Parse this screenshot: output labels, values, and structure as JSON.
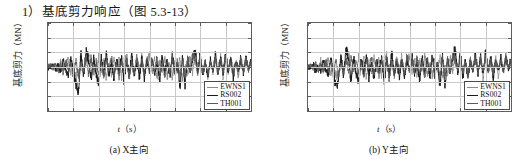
{
  "heading": "1）基底剪力响应（图 5.3-13）",
  "figures": [
    {
      "caption": "(a) X主向",
      "ylabel": "基底剪力（MN）",
      "xlabel_var": "t",
      "xlabel_unit": "（s）"
    },
    {
      "caption": "(b) Y主向",
      "ylabel": "基底剪力（MN）",
      "xlabel_var": "t",
      "xlabel_unit": "（s）"
    }
  ],
  "legend": {
    "items": [
      {
        "label": "EWNS1",
        "color": "#8c8c8c"
      },
      {
        "label": "RS002",
        "color": "#1a1a1a"
      },
      {
        "label": "TH001",
        "color": "#5a5a5a"
      }
    ]
  },
  "axis": {
    "y_ticks": [
      "300",
      "200",
      "100",
      "0",
      "-100",
      "-200",
      "-300"
    ],
    "x_ticks": [
      "0",
      "5",
      "10",
      "15",
      "20",
      "25",
      "30",
      "35",
      "40"
    ]
  },
  "chart_data": [
    {
      "type": "line",
      "title": "(a) X主向",
      "xlabel": "t (s)",
      "ylabel": "基底剪力 (MN)",
      "xlim": [
        0,
        40
      ],
      "ylim": [
        -300,
        300
      ],
      "xticks": [
        0,
        5,
        10,
        15,
        20,
        25,
        30,
        35,
        40
      ],
      "yticks": [
        -300,
        -200,
        -100,
        0,
        100,
        200,
        300
      ],
      "grid": true,
      "legend_position": "lower-right",
      "series": [
        {
          "name": "EWNS1",
          "color": "#8c8c8c",
          "x": [
            0,
            0.5,
            1,
            1.5,
            2,
            2.5,
            3,
            3.5,
            4,
            4.5,
            5,
            5.5,
            6,
            6.5,
            7,
            7.5,
            8,
            8.5,
            9,
            9.5,
            10,
            10.5,
            11,
            11.5,
            12,
            12.5,
            13,
            13.5,
            14,
            14.5,
            15,
            15.5,
            16,
            16.5,
            17,
            17.5,
            18,
            18.5,
            19,
            19.5,
            20,
            20.5,
            21,
            21.5,
            22,
            22.5,
            23,
            23.5,
            24,
            24.5,
            25,
            25.5,
            26,
            26.5,
            27,
            27.5,
            28,
            28.5,
            29,
            29.5,
            30,
            30.5,
            31,
            31.5,
            32,
            32.5,
            33,
            33.5,
            34,
            34.5,
            35,
            35.5,
            36,
            36.5,
            37,
            37.5,
            38,
            38.5,
            39,
            39.5,
            40
          ],
          "y": [
            0,
            10,
            -15,
            30,
            -20,
            45,
            -35,
            25,
            60,
            -55,
            40,
            -110,
            -60,
            95,
            -40,
            70,
            130,
            -80,
            55,
            -95,
            85,
            -45,
            65,
            -120,
            50,
            -70,
            95,
            -30,
            75,
            -85,
            60,
            110,
            -65,
            40,
            -100,
            80,
            -50,
            90,
            -75,
            45,
            120,
            -60,
            70,
            -95,
            55,
            -40,
            100,
            -80,
            35,
            -110,
            65,
            -45,
            85,
            -130,
            25,
            -75,
            95,
            -55,
            140,
            -35,
            105,
            -70,
            60,
            -90,
            45,
            -60,
            110,
            -40,
            80,
            -95,
            70,
            -50,
            90,
            -30,
            65,
            -85,
            50,
            -45,
            75,
            -25,
            60
          ]
        },
        {
          "name": "RS002",
          "color": "#1a1a1a",
          "x": [
            0,
            0.5,
            1,
            1.5,
            2,
            2.5,
            3,
            3.5,
            4,
            4.5,
            5,
            5.5,
            6,
            6.5,
            7,
            7.5,
            8,
            8.5,
            9,
            9.5,
            10,
            10.5,
            11,
            11.5,
            12,
            12.5,
            13,
            13.5,
            14,
            14.5,
            15,
            15.5,
            16,
            16.5,
            17,
            17.5,
            18,
            18.5,
            19,
            19.5,
            20,
            20.5,
            21,
            21.5,
            22,
            22.5,
            23,
            23.5,
            24,
            24.5,
            25,
            25.5,
            26,
            26.5,
            27,
            27.5,
            28,
            28.5,
            29,
            29.5,
            30,
            30.5,
            31,
            31.5,
            32,
            32.5,
            33,
            33.5,
            34,
            34.5,
            35,
            35.5,
            36,
            36.5,
            37,
            37.5,
            38,
            38.5,
            39,
            39.5,
            40
          ],
          "y": [
            0,
            -5,
            20,
            -30,
            15,
            -45,
            55,
            -25,
            -70,
            80,
            -40,
            -160,
            -230,
            120,
            -90,
            145,
            60,
            -120,
            100,
            -65,
            -150,
            75,
            -55,
            130,
            -85,
            45,
            -105,
            70,
            -35,
            90,
            -140,
            55,
            -75,
            115,
            -60,
            40,
            -95,
            80,
            -110,
            65,
            -50,
            100,
            -70,
            35,
            -125,
            85,
            -45,
            60,
            -90,
            110,
            -65,
            40,
            -180,
            95,
            -155,
            70,
            -50,
            85,
            160,
            -60,
            120,
            -80,
            55,
            -95,
            70,
            -40,
            105,
            -65,
            90,
            -55,
            130,
            -45,
            75,
            -100,
            60,
            -35,
            80,
            -50,
            95,
            -30,
            70
          ]
        },
        {
          "name": "TH001",
          "color": "#5a5a5a",
          "x": [
            0,
            0.5,
            1,
            1.5,
            2,
            2.5,
            3,
            3.5,
            4,
            4.5,
            5,
            5.5,
            6,
            6.5,
            7,
            7.5,
            8,
            8.5,
            9,
            9.5,
            10,
            10.5,
            11,
            11.5,
            12,
            12.5,
            13,
            13.5,
            14,
            14.5,
            15,
            15.5,
            16,
            16.5,
            17,
            17.5,
            18,
            18.5,
            19,
            19.5,
            20,
            20.5,
            21,
            21.5,
            22,
            22.5,
            23,
            23.5,
            24,
            24.5,
            25,
            25.5,
            26,
            26.5,
            27,
            27.5,
            28,
            28.5,
            29,
            29.5,
            30,
            30.5,
            31,
            31.5,
            32,
            32.5,
            33,
            33.5,
            34,
            34.5,
            35,
            35.5,
            36,
            36.5,
            37,
            37.5,
            38,
            38.5,
            39,
            39.5,
            40
          ],
          "y": [
            0,
            15,
            -10,
            25,
            -35,
            20,
            -50,
            65,
            -30,
            45,
            -75,
            60,
            -95,
            35,
            -55,
            100,
            -70,
            85,
            -45,
            55,
            -80,
            40,
            -100,
            70,
            -25,
            95,
            -60,
            30,
            -85,
            65,
            -40,
            75,
            -110,
            50,
            -65,
            90,
            -35,
            60,
            -80,
            105,
            -50,
            70,
            -45,
            85,
            -60,
            40,
            -90,
            75,
            -55,
            95,
            -70,
            50,
            -120,
            80,
            -95,
            60,
            -40,
            110,
            70,
            -65,
            90,
            -50,
            40,
            -75,
            60,
            -30,
            85,
            -55,
            70,
            -45,
            95,
            -35,
            55,
            -70,
            45,
            -25,
            65,
            -40,
            80,
            -20,
            55
          ]
        }
      ]
    },
    {
      "type": "line",
      "title": "(b) Y主向",
      "xlabel": "t (s)",
      "ylabel": "基底剪力 (MN)",
      "xlim": [
        0,
        40
      ],
      "ylim": [
        -300,
        300
      ],
      "xticks": [
        0,
        5,
        10,
        15,
        20,
        25,
        30,
        35,
        40
      ],
      "yticks": [
        -300,
        -200,
        -100,
        0,
        100,
        200,
        300
      ],
      "grid": true,
      "legend_position": "lower-right",
      "series": [
        {
          "name": "EWNS1",
          "color": "#8c8c8c",
          "x": [
            0,
            0.5,
            1,
            1.5,
            2,
            2.5,
            3,
            3.5,
            4,
            4.5,
            5,
            5.5,
            6,
            6.5,
            7,
            7.5,
            8,
            8.5,
            9,
            9.5,
            10,
            10.5,
            11,
            11.5,
            12,
            12.5,
            13,
            13.5,
            14,
            14.5,
            15,
            15.5,
            16,
            16.5,
            17,
            17.5,
            18,
            18.5,
            19,
            19.5,
            20,
            20.5,
            21,
            21.5,
            22,
            22.5,
            23,
            23.5,
            24,
            24.5,
            25,
            25.5,
            26,
            26.5,
            27,
            27.5,
            28,
            28.5,
            29,
            29.5,
            30,
            30.5,
            31,
            31.5,
            32,
            32.5,
            33,
            33.5,
            34,
            34.5,
            35,
            35.5,
            36,
            36.5,
            37,
            37.5,
            38,
            38.5,
            39,
            39.5,
            40
          ],
          "y": [
            0,
            8,
            -12,
            35,
            -25,
            50,
            -40,
            30,
            65,
            -60,
            45,
            -100,
            -55,
            90,
            -35,
            75,
            120,
            -70,
            60,
            -85,
            80,
            -40,
            70,
            -110,
            55,
            -65,
            90,
            -35,
            80,
            -75,
            65,
            105,
            -60,
            45,
            -95,
            85,
            -45,
            95,
            -70,
            50,
            115,
            -55,
            75,
            -90,
            60,
            -35,
            105,
            -75,
            40,
            -100,
            70,
            -40,
            90,
            -120,
            30,
            -70,
            100,
            -50,
            130,
            -40,
            100,
            -65,
            65,
            -85,
            50,
            -55,
            105,
            -35,
            85,
            -90,
            75,
            -45,
            95,
            -25,
            70,
            -80,
            55,
            -40,
            80,
            -20,
            65
          ]
        },
        {
          "name": "RS002",
          "color": "#1a1a1a",
          "x": [
            0,
            0.5,
            1,
            1.5,
            2,
            2.5,
            3,
            3.5,
            4,
            4.5,
            5,
            5.5,
            6,
            6.5,
            7,
            7.5,
            8,
            8.5,
            9,
            9.5,
            10,
            10.5,
            11,
            11.5,
            12,
            12.5,
            13,
            13.5,
            14,
            14.5,
            15,
            15.5,
            16,
            16.5,
            17,
            17.5,
            18,
            18.5,
            19,
            19.5,
            20,
            20.5,
            21,
            21.5,
            22,
            22.5,
            23,
            23.5,
            24,
            24.5,
            25,
            25.5,
            26,
            26.5,
            27,
            27.5,
            28,
            28.5,
            29,
            29.5,
            30,
            30.5,
            31,
            31.5,
            32,
            32.5,
            33,
            33.5,
            34,
            34.5,
            35,
            35.5,
            36,
            36.5,
            37,
            37.5,
            38,
            38.5,
            39,
            39.5,
            40
          ],
          "y": [
            0,
            -8,
            25,
            -35,
            10,
            -50,
            60,
            -30,
            -80,
            85,
            -45,
            -195,
            -140,
            110,
            -85,
            175,
            55,
            -130,
            95,
            -70,
            -140,
            70,
            -60,
            125,
            -90,
            50,
            -110,
            65,
            -40,
            95,
            -135,
            60,
            -70,
            120,
            -55,
            45,
            -100,
            75,
            -115,
            70,
            -45,
            110,
            -65,
            40,
            -130,
            90,
            -50,
            65,
            -95,
            115,
            -70,
            45,
            -175,
            90,
            -180,
            65,
            -55,
            80,
            175,
            -65,
            125,
            -85,
            60,
            -100,
            65,
            -45,
            110,
            -60,
            95,
            -50,
            135,
            -40,
            80,
            -95,
            65,
            -30,
            85,
            -45,
            100,
            -25,
            75
          ]
        },
        {
          "name": "TH001",
          "color": "#5a5a5a",
          "x": [
            0,
            0.5,
            1,
            1.5,
            2,
            2.5,
            3,
            3.5,
            4,
            4.5,
            5,
            5.5,
            6,
            6.5,
            7,
            7.5,
            8,
            8.5,
            9,
            9.5,
            10,
            10.5,
            11,
            11.5,
            12,
            12.5,
            13,
            13.5,
            14,
            14.5,
            15,
            15.5,
            16,
            16.5,
            17,
            17.5,
            18,
            18.5,
            19,
            19.5,
            20,
            20.5,
            21,
            21.5,
            22,
            22.5,
            23,
            23.5,
            24,
            24.5,
            25,
            25.5,
            26,
            26.5,
            27,
            27.5,
            28,
            28.5,
            29,
            29.5,
            30,
            30.5,
            31,
            31.5,
            32,
            32.5,
            33,
            33.5,
            34,
            34.5,
            35,
            35.5,
            36,
            36.5,
            37,
            37.5,
            38,
            38.5,
            39,
            39.5,
            40
          ],
          "y": [
            0,
            12,
            -15,
            20,
            -30,
            25,
            -45,
            60,
            -35,
            50,
            -70,
            65,
            -90,
            30,
            -60,
            105,
            -65,
            90,
            -40,
            60,
            -75,
            45,
            -95,
            75,
            -30,
            90,
            -55,
            35,
            -80,
            70,
            -45,
            80,
            -105,
            55,
            -60,
            95,
            -40,
            65,
            -75,
            110,
            -45,
            75,
            -50,
            90,
            -55,
            45,
            -85,
            80,
            -50,
            100,
            -65,
            55,
            -115,
            85,
            -90,
            65,
            -45,
            105,
            75,
            -60,
            95,
            -55,
            45,
            -70,
            65,
            -25,
            90,
            -50,
            75,
            -40,
            100,
            -30,
            60,
            -65,
            50,
            -20,
            70,
            -35,
            85,
            -15,
            60
          ]
        }
      ]
    }
  ]
}
